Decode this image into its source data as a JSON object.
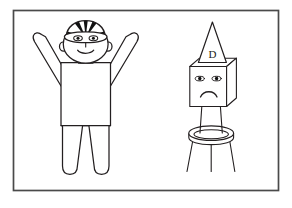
{
  "illustration": {
    "title": "Line drawing of two cartoon figures inside a rectangular frame",
    "background_color": "#ffffff",
    "ink_color": "#231f20",
    "frame": {
      "name": "picture-frame",
      "x": 13,
      "y": 10,
      "width": 266,
      "height": 181,
      "stroke_color": "#4a4a4a",
      "stroke_width": 1.6,
      "fill": "#ffffff"
    },
    "figures": [
      {
        "id": "happy-figure",
        "label": "Happy person with striped cap and raised arms",
        "mood": "happy",
        "headwear": "striped beanie cap",
        "headwear_stripes": 6,
        "headwear_stripe_colors": [
          "#111111",
          "#ffffff"
        ],
        "arms": "raised in V shape",
        "legs": 2,
        "stroke_color": "#231f20",
        "stroke_width": 1.2,
        "fill": "#ffffff"
      },
      {
        "id": "sad-figure",
        "label": "Sad box-headed figure wearing a dunce cap on a stool",
        "mood": "sad",
        "headwear": "dunce cap",
        "headwear_letter": "D",
        "head_shape": "cube",
        "eyes": 2,
        "mouth": "frown",
        "legs": 2,
        "support": "three-legged round stool",
        "stool_legs": 3,
        "stroke_color": "#231f20",
        "stroke_width": 1.1,
        "fill": "#ffffff"
      }
    ]
  }
}
